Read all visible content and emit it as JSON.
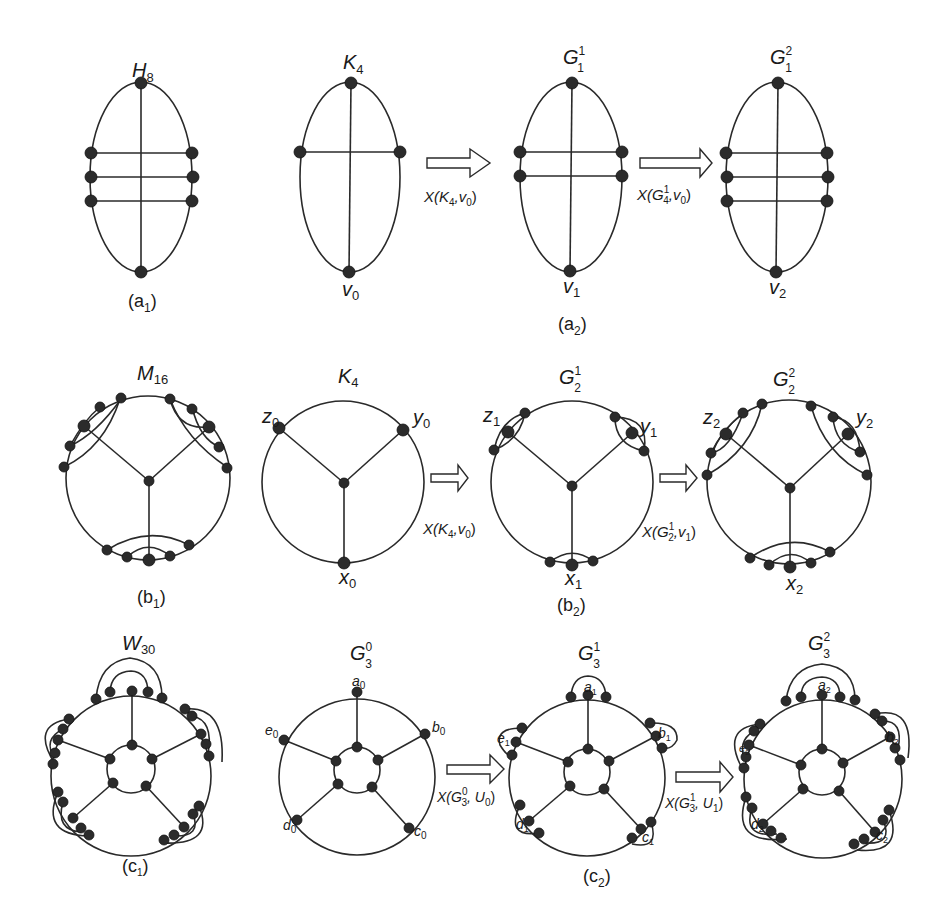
{
  "figure": {
    "rows": [
      {
        "id": "a",
        "panels": [
          {
            "id": "a1",
            "caption": "(a",
            "caption_sub": "1",
            "graphs": [
              {
                "name": "H",
                "sub": "8",
                "sup": "",
                "vertex_labels": []
              }
            ]
          },
          {
            "id": "a2",
            "caption": "(a",
            "caption_sub": "2",
            "graphs": [
              {
                "name": "K",
                "sub": "4",
                "sup": "",
                "vertex_labels": [
                  {
                    "text": "v",
                    "sub": "0"
                  }
                ]
              },
              {
                "name": "G",
                "sub": "1",
                "sup": "1",
                "vertex_labels": [
                  {
                    "text": "v",
                    "sub": "1"
                  }
                ]
              },
              {
                "name": "G",
                "sub": "1",
                "sup": "2",
                "vertex_labels": [
                  {
                    "text": "v",
                    "sub": "2"
                  }
                ]
              }
            ],
            "arrows": [
              {
                "label": "X(K",
                "label_sub": "4",
                "label_sup": "",
                "label_tail": ",v",
                "label_tail_sub": "0",
                "label_end": ")"
              },
              {
                "label": "X(G",
                "label_sub": "4",
                "label_sup": "1",
                "label_tail": ",v",
                "label_tail_sub": "0",
                "label_end": ")"
              }
            ]
          }
        ]
      },
      {
        "id": "b",
        "panels": [
          {
            "id": "b1",
            "caption": "(b",
            "caption_sub": "1",
            "graphs": [
              {
                "name": "M",
                "sub": "16",
                "sup": "",
                "vertex_labels": []
              }
            ]
          },
          {
            "id": "b2",
            "caption": "(b",
            "caption_sub": "2",
            "graphs": [
              {
                "name": "K",
                "sub": "4",
                "sup": "",
                "vertex_labels": [
                  {
                    "text": "z",
                    "sub": "0"
                  },
                  {
                    "text": "y",
                    "sub": "0"
                  },
                  {
                    "text": "x",
                    "sub": "0"
                  }
                ]
              },
              {
                "name": "G",
                "sub": "2",
                "sup": "1",
                "vertex_labels": [
                  {
                    "text": "z",
                    "sub": "1"
                  },
                  {
                    "text": "y",
                    "sub": "1"
                  },
                  {
                    "text": "x",
                    "sub": "1"
                  }
                ]
              },
              {
                "name": "G",
                "sub": "2",
                "sup": "2",
                "vertex_labels": [
                  {
                    "text": "z",
                    "sub": "2"
                  },
                  {
                    "text": "y",
                    "sub": "2"
                  },
                  {
                    "text": "x",
                    "sub": "2"
                  }
                ]
              }
            ],
            "arrows": [
              {
                "label": "X(K",
                "label_sub": "4",
                "label_sup": "",
                "label_tail": ",v",
                "label_tail_sub": "0",
                "label_end": ")"
              },
              {
                "label": "X(G",
                "label_sub": "2",
                "label_sup": "1",
                "label_tail": ",v",
                "label_tail_sub": "1",
                "label_end": ")"
              }
            ]
          }
        ]
      },
      {
        "id": "c",
        "panels": [
          {
            "id": "c1",
            "caption": "(c",
            "caption_sub": "1",
            "graphs": [
              {
                "name": "W",
                "sub": "30",
                "sup": "",
                "vertex_labels": []
              }
            ]
          },
          {
            "id": "c2",
            "caption": "(c",
            "caption_sub": "2",
            "graphs": [
              {
                "name": "G",
                "sub": "3",
                "sup": "0",
                "vertex_labels": [
                  {
                    "text": "a",
                    "sub": "0"
                  },
                  {
                    "text": "b",
                    "sub": "0"
                  },
                  {
                    "text": "c",
                    "sub": "0"
                  },
                  {
                    "text": "d",
                    "sub": "0"
                  },
                  {
                    "text": "e",
                    "sub": "0"
                  }
                ]
              },
              {
                "name": "G",
                "sub": "3",
                "sup": "1",
                "vertex_labels": [
                  {
                    "text": "a",
                    "sub": "1"
                  },
                  {
                    "text": "b",
                    "sub": "1"
                  },
                  {
                    "text": "c",
                    "sub": "1"
                  },
                  {
                    "text": "d",
                    "sub": "1"
                  },
                  {
                    "text": "e",
                    "sub": "1"
                  }
                ]
              },
              {
                "name": "G",
                "sub": "3",
                "sup": "2",
                "vertex_labels": [
                  {
                    "text": "a",
                    "sub": "2"
                  },
                  {
                    "text": "b",
                    "sub": "2"
                  },
                  {
                    "text": "c",
                    "sub": "2"
                  },
                  {
                    "text": "d",
                    "sub": "2"
                  },
                  {
                    "text": "e",
                    "sub": "2"
                  }
                ]
              }
            ],
            "arrows": [
              {
                "label": "X(G",
                "label_sub": "3",
                "label_sup": "0",
                "label_tail": ", U",
                "label_tail_sub": "0",
                "label_end": ")"
              },
              {
                "label": "X(G",
                "label_sub": "3",
                "label_sup": "1",
                "label_tail": ", U",
                "label_tail_sub": "1",
                "label_end": ")"
              }
            ]
          }
        ]
      }
    ]
  }
}
